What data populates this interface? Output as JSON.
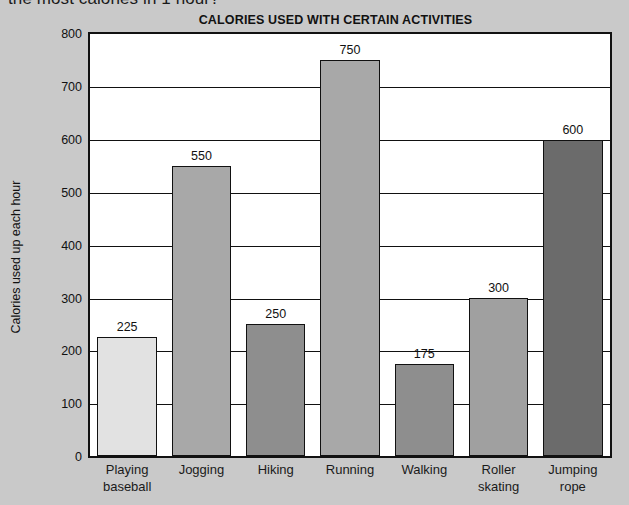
{
  "page": {
    "clipped_question": "the most calories in 1 hour?",
    "background_color": "#c9c9c9"
  },
  "chart_data": {
    "type": "bar",
    "title": "CALORIES USED WITH CERTAIN ACTIVITIES",
    "xlabel": "",
    "ylabel": "Calories used up each hour",
    "ylim": [
      0,
      800
    ],
    "ytick_step": 100,
    "yticks": [
      "800",
      "700",
      "600",
      "500",
      "400",
      "300",
      "200",
      "100",
      "0"
    ],
    "grid": "horizontal",
    "legend": "none",
    "categories": [
      "Playing baseball",
      "Jogging",
      "Hiking",
      "Running",
      "Walking",
      "Roller skating",
      "Jumping rope"
    ],
    "category_lines": [
      [
        "Playing",
        "baseball"
      ],
      [
        "Jogging",
        ""
      ],
      [
        "Hiking",
        ""
      ],
      [
        "Running",
        ""
      ],
      [
        "Walking",
        ""
      ],
      [
        "Roller",
        "skating"
      ],
      [
        "Jumping",
        "rope"
      ]
    ],
    "values": [
      225,
      550,
      250,
      750,
      175,
      300,
      600
    ],
    "value_labels": [
      "225",
      "550",
      "250",
      "750",
      "175",
      "300",
      "600"
    ],
    "bar_colors": [
      "#e2e2e2",
      "#a8a8a8",
      "#8e8e8e",
      "#a8a8a8",
      "#8e8e8e",
      "#a0a0a0",
      "#6b6b6b"
    ],
    "bar_border_color": "#111111",
    "plot_background": "#ffffff",
    "axis_color": "#111111"
  }
}
